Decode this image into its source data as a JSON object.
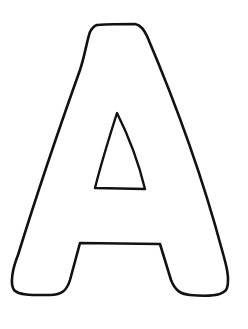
{
  "image": {
    "subject": "Outline of capital letter A (coloring page)",
    "letter": "A",
    "background_color": "#ffffff",
    "stroke_color": "#111111",
    "fill_color": "#ffffff"
  }
}
